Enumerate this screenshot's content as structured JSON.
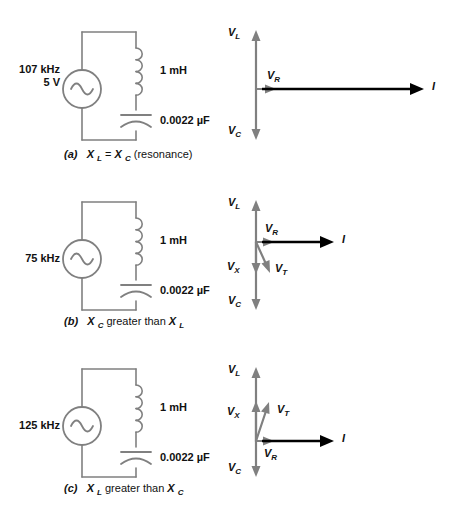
{
  "figure": {
    "colors": {
      "wire": "#808080",
      "phasor_gray": "#808080",
      "phasor_black": "#000000",
      "text": "#111111",
      "background": "#ffffff"
    }
  },
  "panels": [
    {
      "id": "a",
      "caption_id": "(a)",
      "caption_text_1": "X",
      "caption_sub_1": "L",
      "caption_relation": "=",
      "caption_text_2": "X",
      "caption_sub_2": "C",
      "caption_tail": "(resonance)",
      "caption_full": "(a) XL = XC (resonance)",
      "source": {
        "frequency": "107 kHz",
        "voltage": "5 V",
        "symbol": "ac-source-sine"
      },
      "components": [
        {
          "name": "inductor",
          "value": "1 mH"
        },
        {
          "name": "capacitor",
          "value": "0.0022 µF"
        }
      ],
      "phasors": {
        "v_l": {
          "label": "V",
          "sub": "L",
          "direction": "up",
          "color": "#808080"
        },
        "v_c": {
          "label": "V",
          "sub": "C",
          "direction": "down",
          "color": "#808080"
        },
        "v_r": {
          "label": "V",
          "sub": "R",
          "direction": "right",
          "color": "#808080"
        },
        "current": {
          "label": "I",
          "direction": "right",
          "color": "#000000"
        },
        "v_x": null,
        "v_t": null
      }
    },
    {
      "id": "b",
      "caption_id": "(b)",
      "caption_text_1": "X",
      "caption_sub_1": "C",
      "caption_relation": "greater than",
      "caption_text_2": "X",
      "caption_sub_2": "L",
      "caption_tail": "",
      "caption_full": "(b) XC greater than XL",
      "source": {
        "frequency": "75 kHz",
        "voltage": "",
        "symbol": "ac-source-sine"
      },
      "components": [
        {
          "name": "inductor",
          "value": "1 mH"
        },
        {
          "name": "capacitor",
          "value": "0.0022 µF"
        }
      ],
      "phasors": {
        "v_l": {
          "label": "V",
          "sub": "L",
          "direction": "up",
          "color": "#808080"
        },
        "v_c": {
          "label": "V",
          "sub": "C",
          "direction": "down",
          "color": "#808080"
        },
        "v_r": {
          "label": "V",
          "sub": "R",
          "direction": "right",
          "color": "#808080"
        },
        "current": {
          "label": "I",
          "direction": "right",
          "color": "#000000"
        },
        "v_x": {
          "label": "V",
          "sub": "X",
          "direction": "down",
          "color": "#808080"
        },
        "v_t": {
          "label": "V",
          "sub": "T",
          "direction": "down-right",
          "color": "#808080"
        }
      }
    },
    {
      "id": "c",
      "caption_id": "(c)",
      "caption_text_1": "X",
      "caption_sub_1": "L",
      "caption_relation": "greater than",
      "caption_text_2": "X",
      "caption_sub_2": "C",
      "caption_tail": "",
      "caption_full": "(c) XL greater than XC",
      "source": {
        "frequency": "125 kHz",
        "voltage": "",
        "symbol": "ac-source-sine"
      },
      "components": [
        {
          "name": "inductor",
          "value": "1 mH"
        },
        {
          "name": "capacitor",
          "value": "0.0022 µF"
        }
      ],
      "phasors": {
        "v_l": {
          "label": "V",
          "sub": "L",
          "direction": "up",
          "color": "#808080"
        },
        "v_c": {
          "label": "V",
          "sub": "C",
          "direction": "down",
          "color": "#808080"
        },
        "v_r": {
          "label": "V",
          "sub": "R",
          "direction": "right",
          "color": "#808080"
        },
        "current": {
          "label": "I",
          "direction": "right",
          "color": "#000000"
        },
        "v_x": {
          "label": "V",
          "sub": "X",
          "direction": "up",
          "color": "#808080"
        },
        "v_t": {
          "label": "V",
          "sub": "T",
          "direction": "up-right",
          "color": "#808080"
        }
      }
    }
  ]
}
